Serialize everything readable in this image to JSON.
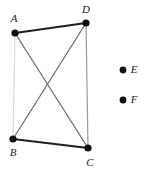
{
  "figure": {
    "background_color": "#ffffff",
    "width": 145,
    "height": 175,
    "vertices": [
      {
        "id": "A",
        "label": "A",
        "x": 15,
        "y": 33,
        "r": 3.6,
        "color": "#111111",
        "label_x": 14,
        "label_y": 19
      },
      {
        "id": "D",
        "label": "D",
        "x": 86,
        "y": 23,
        "r": 3.6,
        "color": "#111111",
        "label_x": 86,
        "label_y": 10
      },
      {
        "id": "B",
        "label": "B",
        "x": 13,
        "y": 139,
        "r": 3.6,
        "color": "#111111",
        "label_x": 13,
        "label_y": 153
      },
      {
        "id": "C",
        "label": "C",
        "x": 88,
        "y": 148,
        "r": 3.6,
        "color": "#111111",
        "label_x": 90,
        "label_y": 163
      }
    ],
    "edges": [
      {
        "id": "AD",
        "from": "A",
        "to": "D",
        "x1": 15,
        "y1": 33,
        "x2": 86,
        "y2": 23,
        "color": "#1f1f1f",
        "width": 2.2
      },
      {
        "id": "BC",
        "from": "B",
        "to": "C",
        "x1": 13,
        "y1": 139,
        "x2": 88,
        "y2": 148,
        "color": "#1f1f1f",
        "width": 2.2
      },
      {
        "id": "AB",
        "from": "A",
        "to": "B",
        "x1": 15,
        "y1": 33,
        "x2": 13,
        "y2": 139,
        "color": "#dcdcdc",
        "width": 1.2
      },
      {
        "id": "DC",
        "from": "D",
        "to": "C",
        "x1": 86,
        "y1": 23,
        "x2": 88,
        "y2": 148,
        "color": "#9a9a9a",
        "width": 1.2
      },
      {
        "id": "AC",
        "from": "A",
        "to": "C",
        "x1": 15,
        "y1": 33,
        "x2": 88,
        "y2": 148,
        "color": "#6e6e6e",
        "width": 1.3
      },
      {
        "id": "BD",
        "from": "B",
        "to": "D",
        "x1": 13,
        "y1": 139,
        "x2": 86,
        "y2": 23,
        "color": "#6e6e6e",
        "width": 1.3
      }
    ],
    "isolated_points": [
      {
        "id": "E",
        "label": "E",
        "x": 123,
        "y": 70,
        "r": 3.4,
        "color": "#111111",
        "label_x": 134,
        "label_y": 70
      },
      {
        "id": "F",
        "label": "F",
        "x": 123,
        "y": 100,
        "r": 3.4,
        "color": "#111111",
        "label_x": 134,
        "label_y": 100
      }
    ]
  }
}
